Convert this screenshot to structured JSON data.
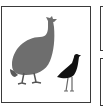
{
  "illustration": {
    "main_panel": {
      "subjects": [
        "guineafowl",
        "plover"
      ],
      "guineafowl_color": "#6e6e6e",
      "plover_color": "#111111",
      "border_color": "#3a3a3a",
      "background": "#ffffff"
    },
    "side_panels": [
      {
        "position": "top-right"
      },
      {
        "position": "bottom-right"
      }
    ]
  }
}
